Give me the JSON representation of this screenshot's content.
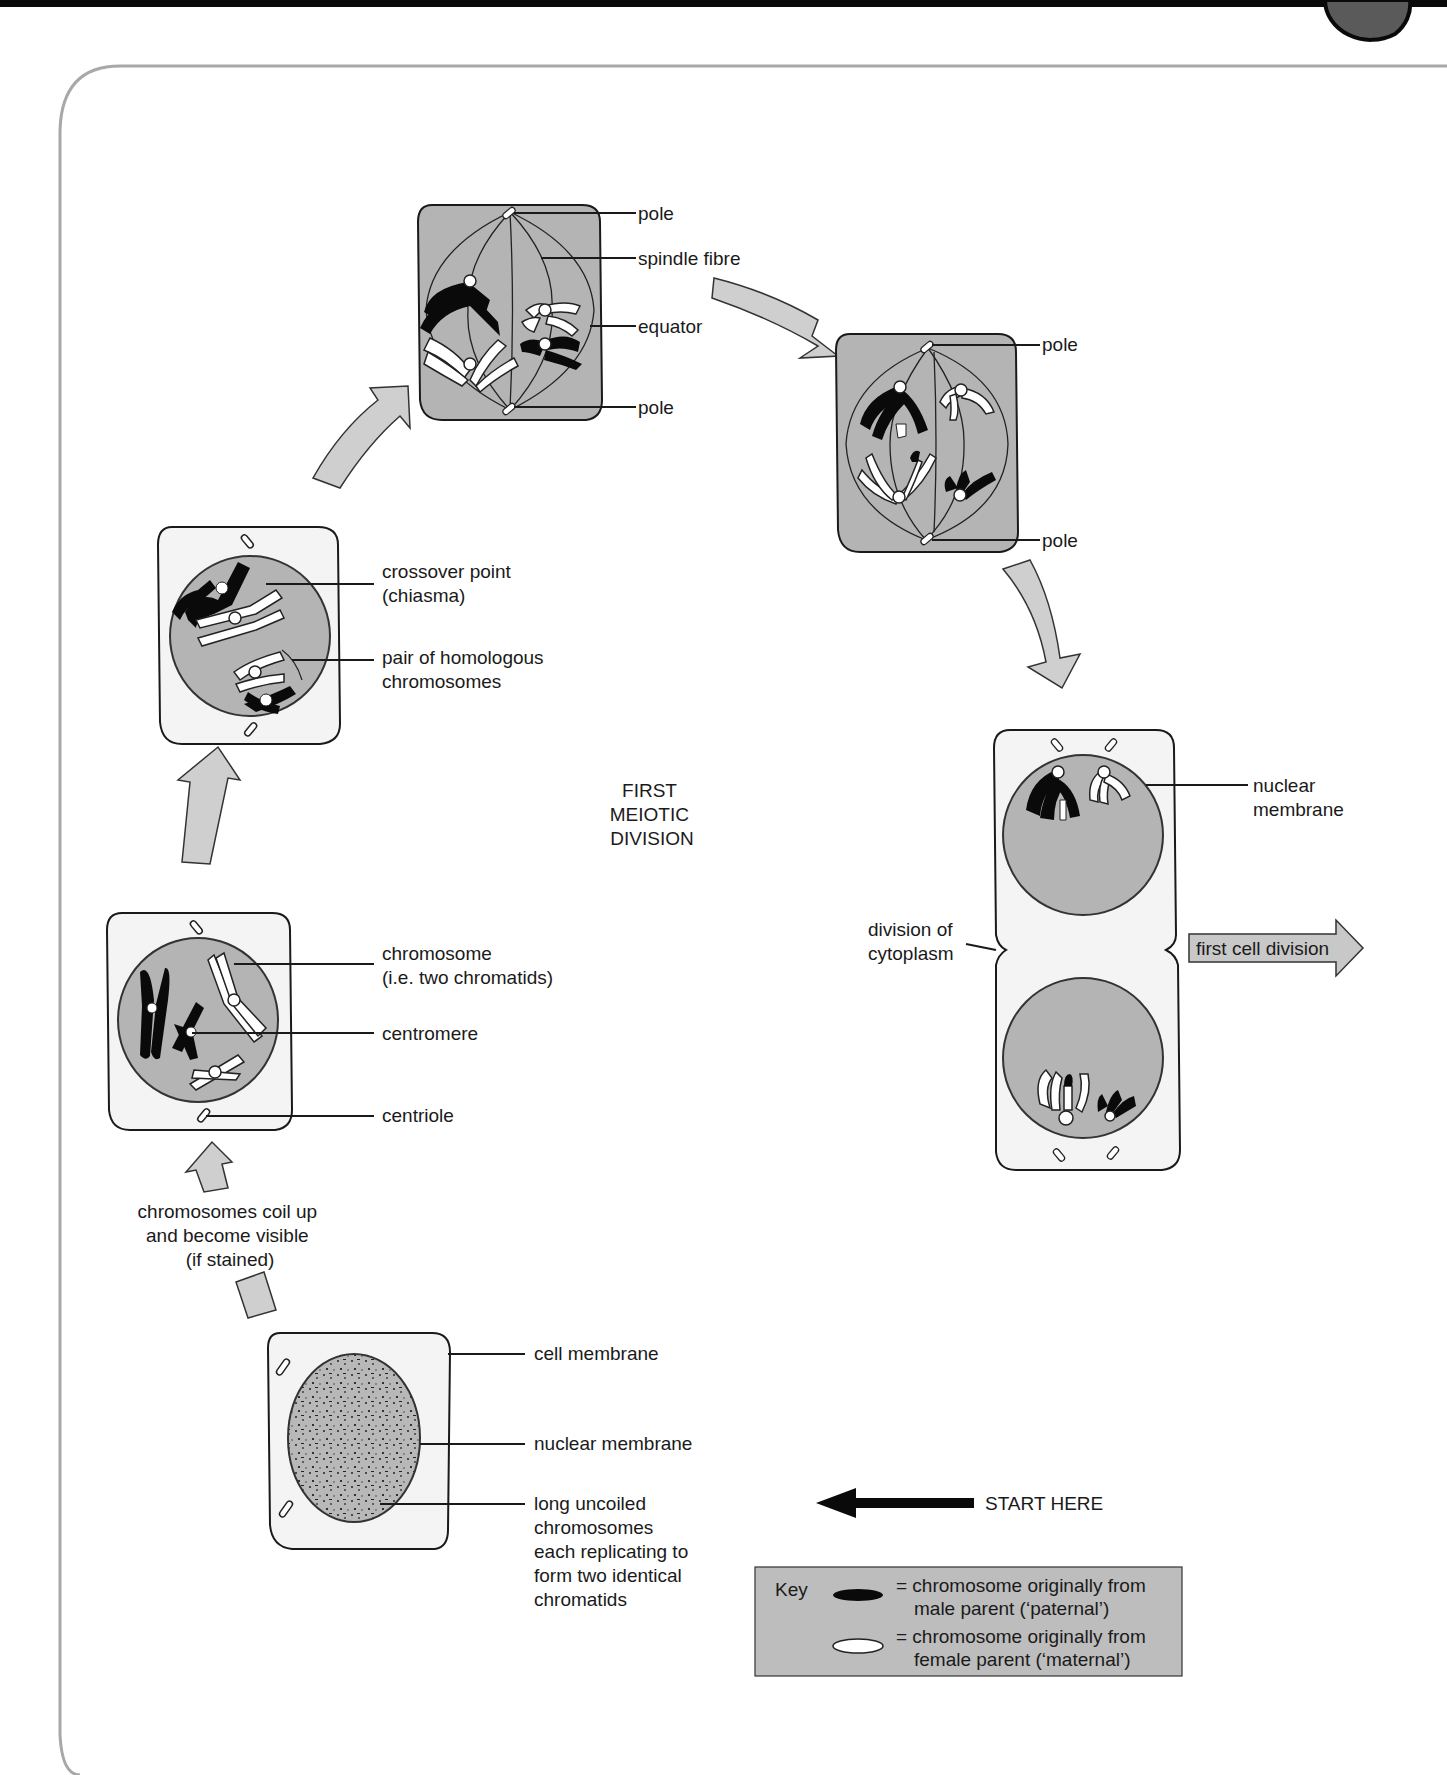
{
  "diagram": {
    "title": "FIRST MEIOTIC DIVISION",
    "title_lines": [
      "FIRST",
      "MEIOTIC",
      "DIVISION"
    ],
    "colors": {
      "top_bar": "#0a0a0a",
      "tab_circle": "#5a5a5a",
      "frame_border": "#a8a8a8",
      "cell_fill_light": "#f4f4f4",
      "cell_fill_dark": "#b4b4b4",
      "nucleus_fill": "#b4b4b4",
      "arrow_fill": "#cfcfcf",
      "paternal": "#0a0a0a",
      "maternal": "#ffffff",
      "key_fill": "#bdbdbd"
    },
    "stages": [
      {
        "id": "interphase",
        "labels": [
          "cell membrane",
          "nuclear membrane",
          "long uncoiled chromosomes each replicating to form two identical chromatids"
        ],
        "label_lines": {
          "cell_membrane": [
            "cell membrane"
          ],
          "nuclear_membrane": [
            "nuclear membrane"
          ],
          "uncoiled": [
            "long uncoiled",
            "chromosomes",
            "each replicating to",
            "form two identical",
            "chromatids"
          ]
        }
      },
      {
        "id": "transition-note",
        "label_lines": [
          "chromosomes coil up",
          "and become visible",
          "(if stained)"
        ]
      },
      {
        "id": "prophase-early",
        "label_lines": {
          "chromosome": [
            "chromosome",
            "(i.e. two chromatids)"
          ],
          "centromere": [
            "centromere"
          ],
          "centriole": [
            "centriole"
          ]
        }
      },
      {
        "id": "prophase-late",
        "label_lines": {
          "crossover": [
            "crossover point",
            "(chiasma)"
          ],
          "homologous": [
            "pair of homologous",
            "chromosomes"
          ]
        }
      },
      {
        "id": "metaphase",
        "label_lines": {
          "pole_top": [
            "pole"
          ],
          "spindle": [
            "spindle fibre"
          ],
          "equator": [
            "equator"
          ],
          "pole_bottom": [
            "pole"
          ]
        }
      },
      {
        "id": "anaphase",
        "label_lines": {
          "pole_top": [
            "pole"
          ],
          "pole_bottom": [
            "pole"
          ]
        }
      },
      {
        "id": "telophase",
        "label_lines": {
          "nuclear_membrane": [
            "nuclear",
            "membrane"
          ],
          "cytoplasm": [
            "division of",
            "cytoplasm"
          ]
        },
        "next_arrow_label": "first cell division"
      }
    ],
    "start": {
      "label": "START HERE"
    },
    "key": {
      "title": "Key",
      "items": [
        {
          "symbol": "black-chromosome",
          "lines": [
            "= chromosome originally from",
            "male parent (‘paternal’)"
          ]
        },
        {
          "symbol": "white-chromosome",
          "lines": [
            "= chromosome originally from",
            "female parent (‘maternal’)"
          ]
        }
      ]
    }
  }
}
